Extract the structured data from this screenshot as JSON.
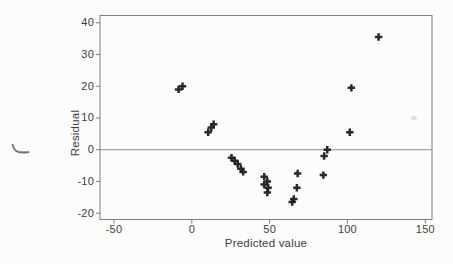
{
  "figure": {
    "background": "#fcfcfb",
    "marker_color": "#1d1d1d",
    "axis_color": "#7e7e7e",
    "zero_line_color": "#8f8f8f",
    "text_color": "#3e3e3e"
  },
  "chart_data": {
    "type": "scatter",
    "title": "",
    "xlabel": "Predicted value",
    "ylabel": "Residual",
    "marker": "plus",
    "grid": false,
    "reference_line_y": 0,
    "xlim": [
      -59,
      154.3
    ],
    "ylim": [
      -22,
      42.3
    ],
    "x_ticks": [
      -50,
      0,
      50,
      100,
      150
    ],
    "y_ticks": [
      40,
      30,
      20,
      10,
      0,
      -10,
      -20
    ],
    "points": [
      {
        "x": -8.5,
        "y": 19
      },
      {
        "x": -6,
        "y": 20
      },
      {
        "x": 10.5,
        "y": 5.5
      },
      {
        "x": 12.5,
        "y": 7
      },
      {
        "x": 14,
        "y": 8
      },
      {
        "x": 25.5,
        "y": -2.5
      },
      {
        "x": 27.5,
        "y": -3.5
      },
      {
        "x": 29.5,
        "y": -4.5
      },
      {
        "x": 31.5,
        "y": -6
      },
      {
        "x": 33,
        "y": -7
      },
      {
        "x": 46.5,
        "y": -8.5
      },
      {
        "x": 48.5,
        "y": -10
      },
      {
        "x": 46.5,
        "y": -11
      },
      {
        "x": 49,
        "y": -12
      },
      {
        "x": 48.5,
        "y": -13.5
      },
      {
        "x": 68,
        "y": -7.5
      },
      {
        "x": 67.5,
        "y": -12
      },
      {
        "x": 65.5,
        "y": -15.5
      },
      {
        "x": 64.5,
        "y": -16.5
      },
      {
        "x": 87,
        "y": 0
      },
      {
        "x": 85,
        "y": -2
      },
      {
        "x": 84.5,
        "y": -8
      },
      {
        "x": 102.5,
        "y": 19.5
      },
      {
        "x": 101.5,
        "y": 5.5
      },
      {
        "x": 120,
        "y": 35.5
      }
    ]
  },
  "artifacts": {
    "stray_pen_mark": "small handwritten tick at left margin",
    "scan_smudge": "faint gray smudge inside plot at right"
  }
}
